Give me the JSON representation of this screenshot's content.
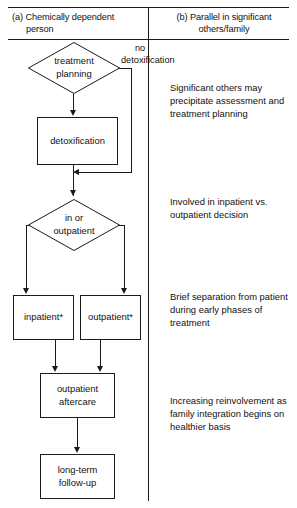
{
  "figure": {
    "columns": {
      "a": {
        "label_line1": "(a) Chemically dependent",
        "label_line2": "person"
      },
      "b": {
        "label_line1": "(b) Parallel in significant",
        "label_line2": "others/family"
      }
    },
    "flow": {
      "decision_treatment": {
        "line1": "treatment",
        "line2": "planning"
      },
      "edge_no_detox": {
        "line1": "no",
        "line2": "detoxification"
      },
      "box_detox": {
        "label": "detoxification"
      },
      "decision_setting": {
        "line1": "in or",
        "line2": "outpatient"
      },
      "box_inpatient": {
        "label": "inpatient*"
      },
      "box_outpatient": {
        "label": "outpatient*"
      },
      "box_aftercare": {
        "line1": "outpatient",
        "line2": "aftercare"
      },
      "box_followup": {
        "line1": "long-term",
        "line2": "follow-up"
      }
    },
    "notes": {
      "note_1": "Significant others may precipitate assessment and treatment planning",
      "note_2": "Involved in inpatient vs. outpatient decision",
      "note_3": "Brief separation from patient during early phases of treatment",
      "note_4": "Increasing reinvolvement as family integration begins on healthier basis"
    },
    "colors": {
      "ink": "#1a1a1a",
      "background": "#ffffff"
    }
  }
}
